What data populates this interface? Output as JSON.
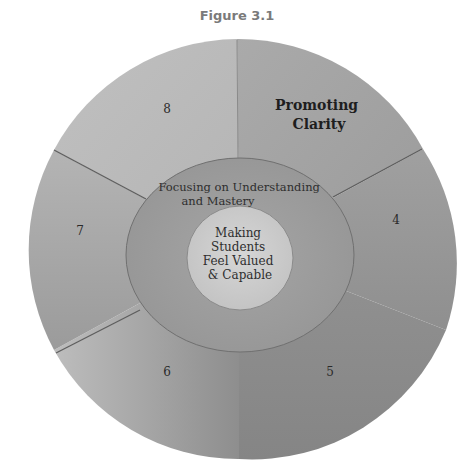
{
  "figure": {
    "title": "Figure 3.1"
  },
  "outer_ring": {
    "segments": [
      {
        "id": "promoting-clarity",
        "label_lines": [
          "Promoting",
          "Clarity"
        ],
        "emphasized": true
      },
      {
        "id": "4",
        "label_lines": [
          "4"
        ]
      },
      {
        "id": "5",
        "label_lines": [
          "5"
        ]
      },
      {
        "id": "6",
        "label_lines": [
          "6"
        ]
      },
      {
        "id": "7",
        "label_lines": [
          "7"
        ]
      },
      {
        "id": "8",
        "label_lines": [
          "8"
        ]
      }
    ]
  },
  "middle_ring": {
    "label_lines": [
      "Focusing on Understanding",
      "and Mastery"
    ]
  },
  "core": {
    "label_lines": [
      "Making",
      "Students",
      "Feel Valued",
      "& Capable"
    ]
  },
  "colors": {
    "outer_fill_light": "#b9b9b9",
    "outer_fill_dark": "#8e8e8e",
    "middle_fill": "#9d9d9d",
    "core_fill": "#cdcdcd",
    "divider": "#6a6a6a",
    "title": "#7a7a7a"
  }
}
